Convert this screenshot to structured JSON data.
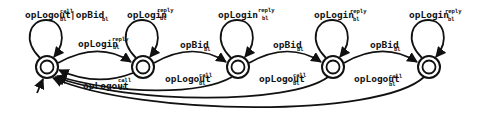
{
  "diagram": {
    "type": "state-machine",
    "colors": {
      "stroke": "#111111",
      "background": "#ffffff"
    },
    "states": [
      {
        "id": "s0",
        "x": 47,
        "y": 67,
        "initial": true,
        "accepting": true
      },
      {
        "id": "s1",
        "x": 143,
        "y": 67,
        "initial": false,
        "accepting": true
      },
      {
        "id": "s2",
        "x": 238,
        "y": 67,
        "initial": false,
        "accepting": true
      },
      {
        "id": "s3",
        "x": 333,
        "y": 67,
        "initial": false,
        "accepting": true
      },
      {
        "id": "s4",
        "x": 429,
        "y": 67,
        "initial": false,
        "accepting": true
      }
    ],
    "labels": {
      "s0_loop": {
        "base": "opLogout",
        "sup": "call",
        "sub": "bl",
        "extra": "|opBid",
        "extra_sub": "bl"
      },
      "s1_loop": {
        "base": "opLogin",
        "sup": "reply",
        "sub": "bl"
      },
      "s2_loop": {
        "base": "opLogin",
        "sup": "reply",
        "sub": "bl"
      },
      "s3_loop": {
        "base": "opLogin",
        "sup": "reply",
        "sub": "bl"
      },
      "s4_loop": {
        "base": "opLogin",
        "sup": "reply",
        "sub": "bl"
      },
      "s0_s1": {
        "base": "opLogin",
        "sup": "reply",
        "sub": "bl"
      },
      "s1_s0": {
        "base": "opLogout",
        "sup": "call",
        "sub": "bl"
      },
      "s1_s2": {
        "base": "opBid",
        "sub": "bl"
      },
      "s2_s3": {
        "base": "opBid",
        "sub": "bl"
      },
      "s3_s4": {
        "base": "opBid",
        "sub": "bl"
      },
      "s2_s0": {
        "base": "opLogout",
        "sup": "call",
        "sub": "bl"
      },
      "s3_s0": {
        "base": "opLogout",
        "sup": "call",
        "sub": "bl"
      },
      "s4_s0": {
        "base": "opLogout",
        "sup": "call",
        "sub": "bl"
      }
    }
  }
}
